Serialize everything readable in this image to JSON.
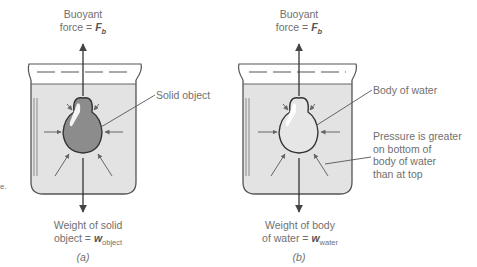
{
  "figure": {
    "panels": [
      {
        "id": "a",
        "caption": "(a)",
        "top_label_line1": "Buoyant",
        "top_label_prefix": "force = ",
        "top_label_symbol": "F",
        "top_label_sub": "b",
        "callout": "Solid object",
        "bottom_label_line1": "Weight of solid",
        "bottom_label_prefix": "object = ",
        "bottom_label_symbol": "w",
        "bottom_label_sub": "object",
        "object_fill": "#8c8c8c"
      },
      {
        "id": "b",
        "caption": "(b)",
        "top_label_line1": "Buoyant",
        "top_label_prefix": "force = ",
        "top_label_symbol": "F",
        "top_label_sub": "b",
        "callout": "Body of water",
        "callout2": [
          "Pressure is greater",
          "on bottom of",
          "body of water",
          "than at top"
        ],
        "bottom_label_line1": "Weight of body",
        "bottom_label_prefix": "of water = ",
        "bottom_label_symbol": "w",
        "bottom_label_sub": "water",
        "object_fill": "#e6e6e6"
      }
    ],
    "edge_fragment": "e.",
    "colors": {
      "water": "#e3e3e3",
      "outline": "#444444",
      "arrow": "#555555",
      "text": "#707070"
    }
  }
}
